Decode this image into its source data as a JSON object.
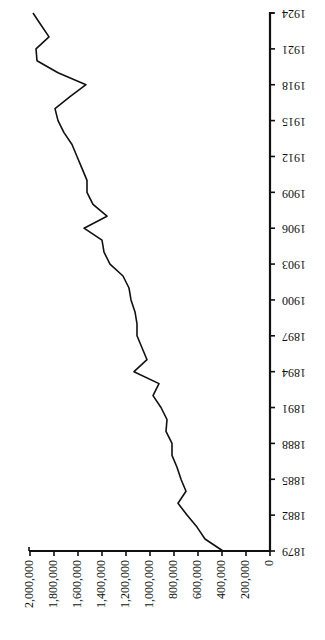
{
  "chart_data": {
    "type": "line",
    "orientation": "rotated-90-clockwise",
    "title": "",
    "xlabel": "",
    "ylabel": "",
    "x": [
      1879,
      1880,
      1881,
      1882,
      1883,
      1884,
      1885,
      1886,
      1887,
      1888,
      1889,
      1890,
      1891,
      1892,
      1893,
      1894,
      1895,
      1896,
      1897,
      1898,
      1899,
      1900,
      1901,
      1902,
      1903,
      1904,
      1905,
      1906,
      1907,
      1908,
      1909,
      1910,
      1911,
      1912,
      1913,
      1914,
      1915,
      1916,
      1917,
      1918,
      1919,
      1920,
      1921,
      1922,
      1923,
      1924
    ],
    "values": [
      392000,
      542000,
      608000,
      692000,
      767000,
      700000,
      742000,
      775000,
      817000,
      817000,
      867000,
      858000,
      908000,
      975000,
      925000,
      1133000,
      1025000,
      1067000,
      1108000,
      1108000,
      1125000,
      1158000,
      1175000,
      1225000,
      1333000,
      1383000,
      1400000,
      1550000,
      1358000,
      1475000,
      1525000,
      1525000,
      1567000,
      1608000,
      1650000,
      1717000,
      1767000,
      1792000,
      1667000,
      1533000,
      1767000,
      1942000,
      1950000,
      1842000,
      1908000,
      1975000
    ],
    "x_tick_labels": [
      "1879",
      "1882",
      "1885",
      "1888",
      "1891",
      "1894",
      "1897",
      "1900",
      "1903",
      "1906",
      "1909",
      "1912",
      "1915",
      "1918",
      "1921",
      "1924"
    ],
    "y_tick_values": [
      0,
      200000,
      400000,
      600000,
      800000,
      1000000,
      1200000,
      1400000,
      1600000,
      1800000,
      2000000
    ],
    "y_tick_labels": [
      "0",
      "200,000",
      "400,000",
      "600,000",
      "800,000",
      "1,000,000",
      "1,200,000",
      "1,400,000",
      "1,600,000",
      "1,800,000",
      "2,000,000"
    ],
    "xlim": [
      1879,
      1924
    ],
    "ylim": [
      0,
      2000000
    ],
    "grid": false,
    "legend": null,
    "line_color": "#111111"
  }
}
